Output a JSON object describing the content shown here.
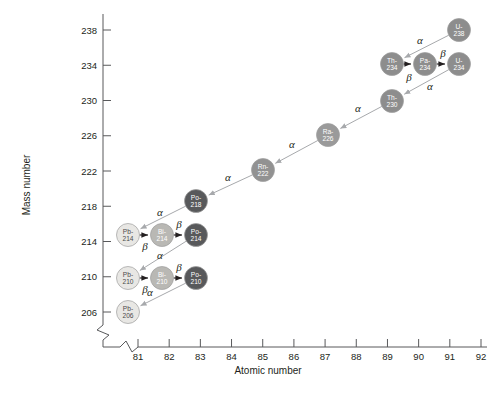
{
  "figure": {
    "axes": {
      "x": {
        "label": "Atomic number",
        "ticks": [
          81,
          82,
          83,
          84,
          85,
          86,
          87,
          88,
          89,
          90,
          91,
          92
        ],
        "min": 80.5,
        "max": 92.6,
        "broken": true
      },
      "y": {
        "label": "Mass number",
        "ticks": [
          206,
          210,
          214,
          218,
          222,
          226,
          230,
          234,
          238
        ],
        "min": 204,
        "max": 239,
        "broken": true
      }
    }
  },
  "colors": {
    "lead": "#e8e7e4",
    "bismuth": "#b9b8b4",
    "polonium": "#58595b",
    "radon": "#929292",
    "radium": "#9a9a9a",
    "thorium": "#8d8d8d",
    "protactinium": "#8d8d8d",
    "uranium": "#8d8d8d",
    "alpha_arrow": "#a7a9ac",
    "beta_arrow": "#231f20",
    "axis": "#58595b",
    "text": "#231f20"
  },
  "chart_data": {
    "type": "scatter",
    "xlabel": "Atomic number",
    "ylabel": "Mass number",
    "xlim": [
      80.5,
      92.6
    ],
    "ylim": [
      204,
      239
    ],
    "xticks": [
      81,
      82,
      83,
      84,
      85,
      86,
      87,
      88,
      89,
      90,
      91,
      92
    ],
    "yticks": [
      206,
      210,
      214,
      218,
      222,
      226,
      230,
      234,
      238
    ],
    "grid": false,
    "legend": null,
    "nuclides": [
      {
        "id": "u238",
        "symbol": "U-",
        "mass": "238",
        "element": "uranium",
        "z": 92,
        "a": 238,
        "px": 459,
        "py": 30,
        "fill": "#8d8d8d",
        "dark_text": false
      },
      {
        "id": "th234",
        "symbol": "Th-",
        "mass": "234",
        "element": "thorium",
        "z": 90,
        "a": 234,
        "px": 392,
        "py": 64,
        "fill": "#8d8d8d",
        "dark_text": false
      },
      {
        "id": "pa234",
        "symbol": "Pa-",
        "mass": "234",
        "element": "protactinium",
        "z": 91,
        "a": 234,
        "px": 425,
        "py": 64,
        "fill": "#8d8d8d",
        "dark_text": false
      },
      {
        "id": "u234",
        "symbol": "U-",
        "mass": "234",
        "element": "uranium",
        "z": 92,
        "a": 234,
        "px": 459,
        "py": 64,
        "fill": "#8d8d8d",
        "dark_text": false
      },
      {
        "id": "th230",
        "symbol": "Th-",
        "mass": "230",
        "element": "thorium",
        "z": 90,
        "a": 230,
        "px": 392,
        "py": 101,
        "fill": "#8d8d8d",
        "dark_text": false
      },
      {
        "id": "ra226",
        "symbol": "Ra-",
        "mass": "226",
        "element": "radium",
        "z": 88,
        "a": 226,
        "px": 328,
        "py": 135,
        "fill": "#9a9a9a",
        "dark_text": false
      },
      {
        "id": "rn222",
        "symbol": "Rn-",
        "mass": "222",
        "element": "radon",
        "z": 86,
        "a": 222,
        "px": 263,
        "py": 170,
        "fill": "#929292",
        "dark_text": false
      },
      {
        "id": "po218",
        "symbol": "Po-",
        "mass": "218",
        "element": "polonium",
        "z": 84,
        "a": 218,
        "px": 196,
        "py": 201,
        "fill": "#58595b",
        "dark_text": false
      },
      {
        "id": "pb214",
        "symbol": "Pb-",
        "mass": "214",
        "element": "lead",
        "z": 82,
        "a": 214,
        "px": 128,
        "py": 235,
        "fill": "#e8e7e4",
        "dark_text": true
      },
      {
        "id": "bi214",
        "symbol": "Bi-",
        "mass": "214",
        "element": "bismuth",
        "z": 83,
        "a": 214,
        "px": 162,
        "py": 235,
        "fill": "#b9b8b4",
        "dark_text": false
      },
      {
        "id": "po214",
        "symbol": "Po-",
        "mass": "214",
        "element": "polonium",
        "z": 84,
        "a": 214,
        "px": 196,
        "py": 235,
        "fill": "#58595b",
        "dark_text": false
      },
      {
        "id": "pb210",
        "symbol": "Pb-",
        "mass": "210",
        "element": "lead",
        "z": 82,
        "a": 210,
        "px": 128,
        "py": 278,
        "fill": "#e8e7e4",
        "dark_text": true
      },
      {
        "id": "bi210",
        "symbol": "Bi-",
        "mass": "210",
        "element": "bismuth",
        "z": 83,
        "a": 210,
        "px": 162,
        "py": 278,
        "fill": "#b9b8b4",
        "dark_text": false
      },
      {
        "id": "po210",
        "symbol": "Po-",
        "mass": "210",
        "element": "polonium",
        "z": 84,
        "a": 210,
        "px": 196,
        "py": 278,
        "fill": "#58595b",
        "dark_text": false
      },
      {
        "id": "pb206",
        "symbol": "Pb-",
        "mass": "206",
        "element": "lead",
        "z": 82,
        "a": 206,
        "px": 128,
        "py": 312,
        "fill": "#e8e7e4",
        "dark_text": true
      }
    ],
    "decays": [
      {
        "from": "u238",
        "to": "th234",
        "type": "alpha",
        "label": "α",
        "lx": 420,
        "ly": 44
      },
      {
        "from": "th234",
        "to": "pa234",
        "type": "beta",
        "label": "β",
        "lx": 409,
        "ly": 81
      },
      {
        "from": "pa234",
        "to": "u234",
        "type": "beta",
        "label": "β",
        "lx": 443,
        "ly": 57
      },
      {
        "from": "u234",
        "to": "th230",
        "type": "alpha",
        "label": "α",
        "lx": 430,
        "ly": 90
      },
      {
        "from": "th230",
        "to": "ra226",
        "type": "alpha",
        "label": "α",
        "lx": 358,
        "ly": 112
      },
      {
        "from": "ra226",
        "to": "rn222",
        "type": "alpha",
        "label": "α",
        "lx": 292,
        "ly": 148
      },
      {
        "from": "rn222",
        "to": "po218",
        "type": "alpha",
        "label": "α",
        "lx": 228,
        "ly": 181
      },
      {
        "from": "po218",
        "to": "pb214",
        "type": "alpha",
        "label": "α",
        "lx": 160,
        "ly": 216
      },
      {
        "from": "pb214",
        "to": "bi214",
        "type": "beta",
        "label": "β",
        "lx": 145,
        "ly": 250
      },
      {
        "from": "bi214",
        "to": "po214",
        "type": "beta",
        "label": "β",
        "lx": 179,
        "ly": 228
      },
      {
        "from": "po214",
        "to": "pb210",
        "type": "alpha",
        "label": "α",
        "lx": 160,
        "ly": 259
      },
      {
        "from": "pb210",
        "to": "bi210",
        "type": "beta",
        "label": "β",
        "lx": 145,
        "ly": 293
      },
      {
        "from": "bi210",
        "to": "po210",
        "type": "beta",
        "label": "β",
        "lx": 179,
        "ly": 271
      },
      {
        "from": "po210",
        "to": "pb206",
        "type": "alpha",
        "label": "α",
        "lx": 150,
        "ly": 296
      }
    ]
  }
}
